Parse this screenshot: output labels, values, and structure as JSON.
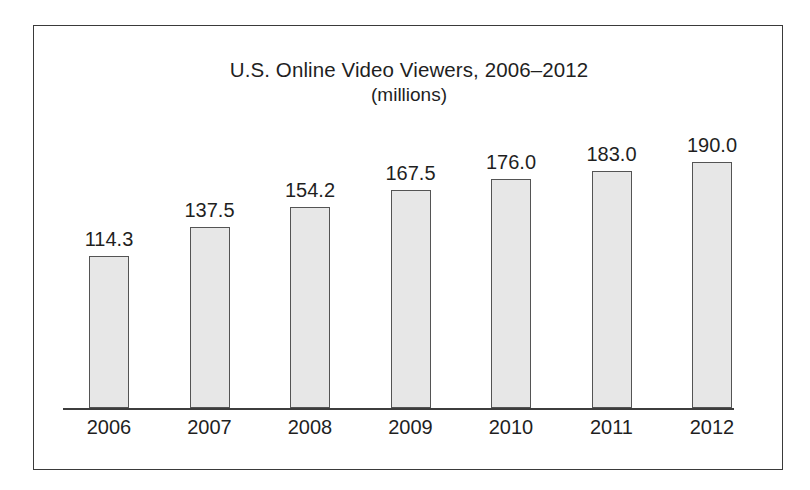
{
  "chart_data": {
    "type": "bar",
    "title": "U.S. Online Video Viewers, 2006–2012",
    "subtitle": "(millions)",
    "xlabel": "",
    "ylabel": "",
    "categories": [
      "2006",
      "2007",
      "2008",
      "2009",
      "2010",
      "2011",
      "2012"
    ],
    "values": [
      114.3,
      137.5,
      154.2,
      167.5,
      176.0,
      183.0,
      190.0
    ],
    "value_labels": [
      "114.3",
      "137.5",
      "154.2",
      "167.5",
      "176.0",
      "183.0",
      "190.0"
    ],
    "ylim": [
      0,
      200
    ],
    "grid": false,
    "legend": null,
    "axis_visible": {
      "x": true,
      "y": false
    },
    "colors": {
      "bar_fill": "#e7e7e7",
      "bar_stroke": "#545454",
      "axis": "#3d3d3d",
      "text": "#1f1f1f",
      "frame": "#3a3a3a",
      "background": "#ffffff"
    }
  }
}
